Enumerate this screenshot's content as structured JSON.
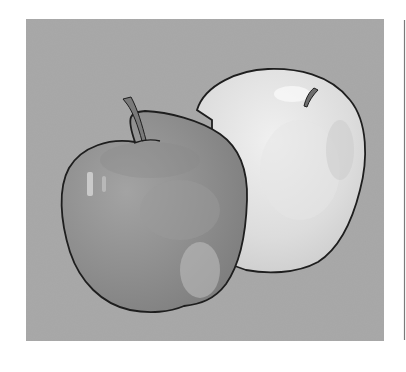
{
  "image": {
    "description": "Grayscale watercolor-style illustration of two apples on a gray square background",
    "subjects": [
      "darker front apple with stem",
      "lighter back apple with stem"
    ],
    "colors": {
      "page_background": "#ffffff",
      "panel_background": "#a9a9a9",
      "front_apple_fill": "#8f8f8f",
      "front_apple_highlight": "#c4c4c4",
      "back_apple_fill": "#dadada",
      "back_apple_highlight": "#f2f2f2",
      "outline": "#1e1e1e",
      "stem": "#6e6e6e",
      "divider_line": "#7a7a7a"
    }
  }
}
